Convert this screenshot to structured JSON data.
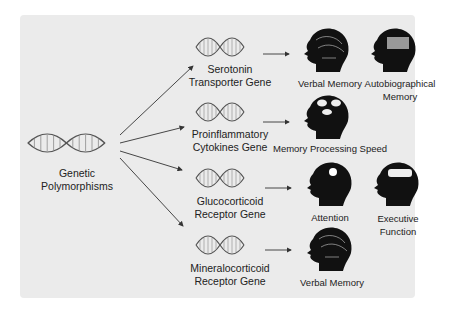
{
  "diagram": {
    "source": {
      "label_line1": "Genetic",
      "label_line2": "Polymorphisms",
      "icon": "dna-helix-icon"
    },
    "genes": [
      {
        "line1": "Serotonin",
        "line2": "Transporter Gene"
      },
      {
        "line1": "Proinflammatory",
        "line2": "Cytokines Gene"
      },
      {
        "line1": "Glucocorticoid",
        "line2": "Receptor Gene"
      },
      {
        "line1": "Mineralocorticoid",
        "line2": "Receptor Gene"
      }
    ],
    "outcomes": {
      "serotonin": [
        {
          "line1": "Verbal Memory",
          "line2": ""
        },
        {
          "line1": "Autobiographical",
          "line2": "Memory"
        }
      ],
      "cytokines": [
        {
          "line1": "Memory Processing Speed",
          "line2": ""
        }
      ],
      "glucocorticoid": [
        {
          "line1": "Attention",
          "line2": ""
        },
        {
          "line1": "Executive",
          "line2": "Function"
        }
      ],
      "mineralocorticoid": [
        {
          "line1": "Verbal Memory",
          "line2": ""
        }
      ]
    },
    "colors": {
      "panel": "#ebebeb",
      "head": "#111111",
      "arrow": "#333333",
      "text": "#222222"
    }
  }
}
